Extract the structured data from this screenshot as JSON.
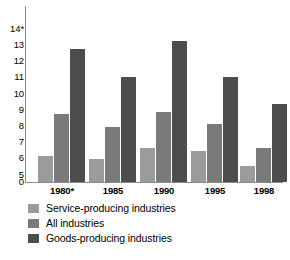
{
  "chart_data": {
    "type": "bar",
    "title": "",
    "xlabel": "",
    "ylabel": "",
    "categories": [
      "1980*",
      "1985",
      "1990",
      "1995",
      "1998"
    ],
    "series": [
      {
        "name": "Service-producing industries",
        "color": "#9b9b9b",
        "values": [
          6.1,
          5.9,
          6.6,
          6.4,
          5.5
        ]
      },
      {
        "name": "All industries",
        "color": "#7a7a7a",
        "values": [
          8.7,
          7.9,
          8.8,
          8.1,
          6.6
        ]
      },
      {
        "name": "Goods-producing industries",
        "color": "#4d4d4d",
        "values": [
          12.7,
          11.0,
          13.2,
          11.0,
          9.3
        ]
      }
    ],
    "yticks": [
      "14*",
      "13",
      "12",
      "11",
      "10",
      "9",
      "8",
      "7",
      "6",
      "5",
      "0"
    ],
    "ytick_values": [
      14,
      13,
      12,
      11,
      10,
      9,
      8,
      7,
      6,
      5,
      0
    ],
    "ylim": [
      5,
      14
    ],
    "axis_break": true,
    "axis_break_note": "y-axis broken between 0 and 5",
    "grid": false,
    "legend_position": "bottom-left",
    "legend": [
      "Service-producing industries",
      "All industries",
      "Goods-producing industries"
    ]
  },
  "footnote": {
    "text": ""
  }
}
